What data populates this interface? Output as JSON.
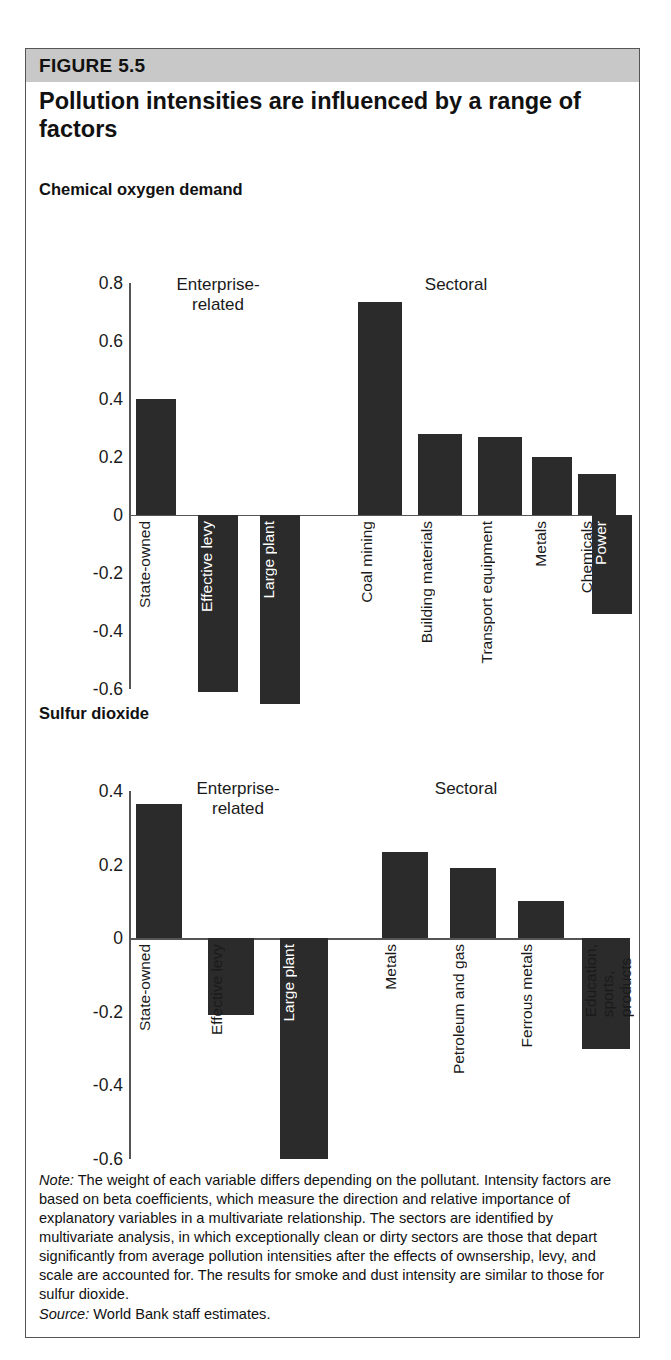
{
  "figure": {
    "band_label": "FIGURE 5.5",
    "title": "Pollution intensities are influenced by a range of factors",
    "note_label": "Note:",
    "note_text": " The weight of each variable differs depending on the pollutant. Intensity factors are based on beta coefficients, which measure the direction and relative importance of explanatory variables in a multivariate relationship. The sectors are identified by multivariate analysis, in which exceptionally clean or dirty sectors are those that depart significantly from average pollution intensities after the effects of ownsership, levy, and scale are accounted for. The results for smoke and dust intensity are similar to those for sulfur dioxide.",
    "source_label": "Source:",
    "source_text": "  World Bank staff estimates.",
    "band_color": "#c8c8c8",
    "bar_color": "#2b2b2b",
    "axis_color": "#555555"
  },
  "chart_data": [
    {
      "type": "bar",
      "title": "Chemical oxygen demand",
      "xlabel": "",
      "ylabel": "",
      "ylim": [
        -0.6,
        0.8
      ],
      "yticks": [
        "0.8",
        "0.6",
        "0.4",
        "0.2",
        "0",
        "-0.2",
        "-0.4",
        "-0.6"
      ],
      "ytick_values": [
        0.8,
        0.6,
        0.4,
        0.2,
        0,
        -0.2,
        -0.4,
        -0.6
      ],
      "grid": false,
      "legend": "none",
      "group_labels": [
        "Enterprise-\nrelated",
        "Sectoral"
      ],
      "categories": [
        "State-owned",
        "Effective levy",
        "Large plant",
        "Coal mining",
        "Building materials",
        "Transport equipment",
        "Metals",
        "Chemicals",
        "Power"
      ],
      "values": [
        0.4,
        -0.61,
        -0.65,
        0.735,
        0.28,
        0.27,
        0.2,
        0.14,
        -0.34
      ],
      "groups": [
        "Enterprise-related",
        "Enterprise-related",
        "Enterprise-related",
        "Sectoral",
        "Sectoral",
        "Sectoral",
        "Sectoral",
        "Sectoral",
        "Sectoral"
      ]
    },
    {
      "type": "bar",
      "title": "Sulfur dioxide",
      "xlabel": "",
      "ylabel": "",
      "ylim": [
        -0.6,
        0.4
      ],
      "yticks": [
        "0.4",
        "0.2",
        "0",
        "-0.2",
        "-0.4",
        "-0.6"
      ],
      "ytick_values": [
        0.4,
        0.2,
        0,
        -0.2,
        -0.4,
        -0.6
      ],
      "grid": false,
      "legend": "none",
      "group_labels": [
        "Enterprise-\nrelated",
        "Sectoral"
      ],
      "categories": [
        "State-owned",
        "Effective levy",
        "Large plant",
        "Metals",
        "Petroleum and gas",
        "Ferrous metals",
        "Education,\nsports,\nproducts"
      ],
      "values": [
        0.365,
        -0.21,
        -0.6,
        0.235,
        0.19,
        0.1,
        -0.3
      ],
      "groups": [
        "Enterprise-related",
        "Enterprise-related",
        "Enterprise-related",
        "Sectoral",
        "Sectoral",
        "Sectoral",
        "Sectoral"
      ]
    }
  ]
}
